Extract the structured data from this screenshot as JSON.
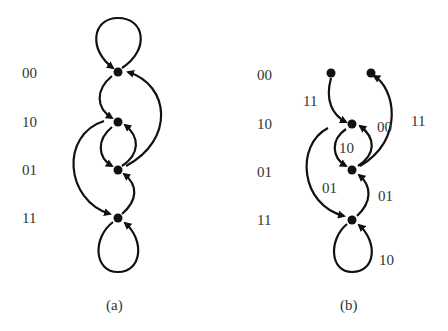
{
  "colors": {
    "ink": "#111111",
    "text": "#333333",
    "background": "#ffffff"
  },
  "panel_a": {
    "caption": "(a)",
    "state_labels": [
      "00",
      "10",
      "01",
      "11"
    ]
  },
  "panel_b": {
    "caption": "(b)",
    "state_labels": [
      "00",
      "10",
      "01",
      "11"
    ],
    "edge_labels": {
      "e_00_to_10": "11",
      "e_10_to_00": "00",
      "e_01_to_00": "11",
      "e_10_to_01": "10",
      "e_10_to_11": "01",
      "e_11_to_01": "01",
      "e_11_self": "10"
    }
  }
}
